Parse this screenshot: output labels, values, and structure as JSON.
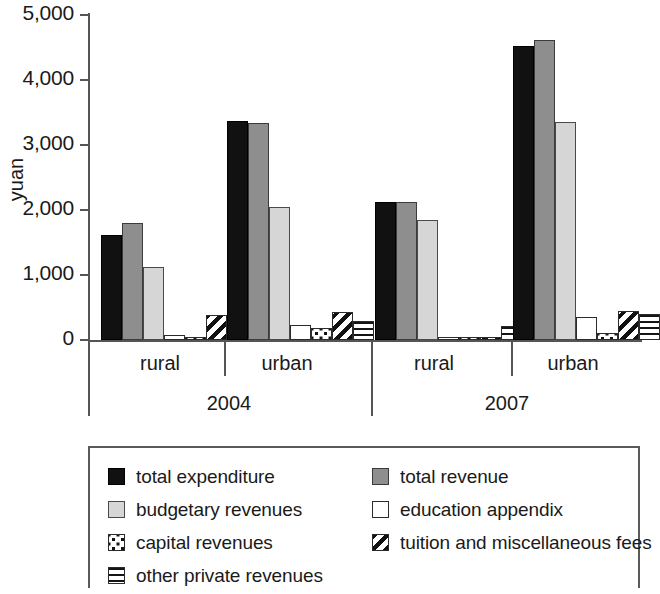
{
  "chart_data": {
    "type": "bar",
    "title": "",
    "xlabel": "",
    "ylabel": "yuan",
    "ylim": [
      0,
      5000
    ],
    "yticks": [
      0,
      1000,
      2000,
      3000,
      4000,
      5000
    ],
    "ytick_labels": [
      "0",
      "1,000",
      "2,000",
      "3,000",
      "4,000",
      "5,000"
    ],
    "grid": false,
    "legend_position": "bottom",
    "group_labels_tier1": [
      "rural",
      "urban",
      "rural",
      "urban"
    ],
    "group_labels_tier2": [
      "2004",
      "2007"
    ],
    "categories": [
      "2004 rural",
      "2004 urban",
      "2007 rural",
      "2007 urban"
    ],
    "series": [
      {
        "name": "total expenditure",
        "pattern": "solid-black",
        "color": "#111111",
        "values": [
          1615,
          3370,
          2120,
          4520
        ]
      },
      {
        "name": "total revenue",
        "pattern": "solid-gray",
        "color": "#8e8e8e",
        "values": [
          1800,
          3340,
          2120,
          4620
        ]
      },
      {
        "name": "budgetary revenues",
        "pattern": "solid-light-gray",
        "color": "#d6d6d6",
        "values": [
          1125,
          2050,
          1840,
          3350
        ]
      },
      {
        "name": "education appendix",
        "pattern": "white",
        "color": "#ffffff",
        "values": [
          70,
          225,
          30,
          350
        ]
      },
      {
        "name": "capital revenues",
        "pattern": "dotted",
        "color": "#ffffff",
        "values": [
          35,
          190,
          25,
          115
        ]
      },
      {
        "name": "tuition and miscellaneous fees",
        "pattern": "diagonal-stripes",
        "color": "#ffffff",
        "values": [
          390,
          430,
          20,
          440
        ]
      },
      {
        "name": "other private revenues",
        "pattern": "horizontal-lines",
        "color": "#ffffff",
        "values": [
          160,
          300,
          215,
          400
        ]
      }
    ]
  },
  "axis": {
    "y_title": "yuan",
    "y_labels": [
      "5,000",
      "4,000",
      "3,000",
      "2,000",
      "1,000",
      "0"
    ],
    "tier1": [
      {
        "label": "rural"
      },
      {
        "label": "urban"
      },
      {
        "label": "rural"
      },
      {
        "label": "urban"
      }
    ],
    "tier2": [
      {
        "label": "2004"
      },
      {
        "label": "2007"
      }
    ]
  },
  "legend": {
    "left_column": [
      {
        "label": "total expenditure",
        "swatch": "solid-black-swatch"
      },
      {
        "label": "budgetary revenues",
        "swatch": "light-gray-swatch"
      },
      {
        "label": "capital revenues",
        "swatch": "dotted-swatch"
      },
      {
        "label": "other private revenues",
        "swatch": "horizontal-lines-swatch"
      }
    ],
    "right_column": [
      {
        "label": "total revenue",
        "swatch": "gray-swatch"
      },
      {
        "label": "education appendix",
        "swatch": "white-swatch"
      },
      {
        "label": "tuition and miscellaneous fees",
        "swatch": "diagonal-stripes-swatch"
      }
    ]
  }
}
